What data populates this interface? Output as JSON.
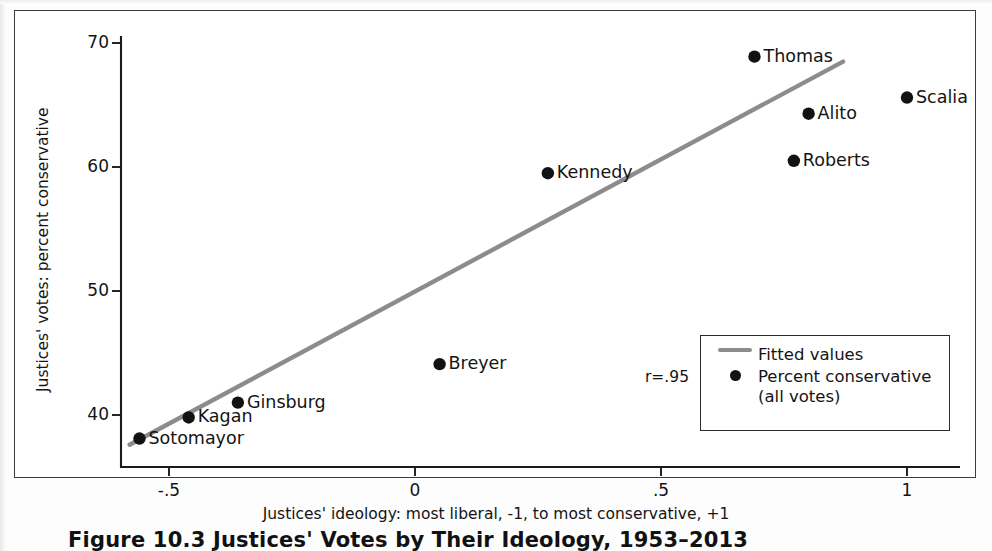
{
  "figure": {
    "caption": "Figure 10.3  Justices' Votes by Their Ideology, 1953–2013",
    "r_note": "r=.95"
  },
  "legend": {
    "fitted_label": "Fitted values",
    "points_label_line1": "Percent conservative",
    "points_label_line2": "(all votes)"
  },
  "colors": {
    "fit_line": "#8c8c8c",
    "point": "#121212",
    "axis": "#1a1a1a",
    "frame": "#3b3b3b"
  },
  "chart_data": {
    "type": "scatter",
    "title": "",
    "xlabel": "Justices' ideology: most liberal, -1, to most conservative, +1",
    "ylabel": "Justices' votes: percent conservative",
    "xlim": [
      -0.62,
      1.1
    ],
    "ylim": [
      36.8,
      71.0
    ],
    "xticks": [
      -0.5,
      0,
      0.5,
      1
    ],
    "xticklabels": [
      "-.5",
      "0",
      ".5",
      "1"
    ],
    "yticks": [
      40,
      50,
      60,
      70
    ],
    "yticklabels": [
      "40",
      "50",
      "60",
      "70"
    ],
    "grid": false,
    "legend_position": "lower-right-inside",
    "correlation": 0.95,
    "points": [
      {
        "label": "Sotomayor",
        "x": -0.56,
        "y": 38.1,
        "label_side": "right"
      },
      {
        "label": "Kagan",
        "x": -0.46,
        "y": 39.8,
        "label_side": "right"
      },
      {
        "label": "Ginsburg",
        "x": -0.36,
        "y": 41.0,
        "label_side": "right"
      },
      {
        "label": "Breyer",
        "x": 0.05,
        "y": 44.1,
        "label_side": "right"
      },
      {
        "label": "Kennedy",
        "x": 0.27,
        "y": 59.5,
        "label_side": "right"
      },
      {
        "label": "Thomas",
        "x": 0.69,
        "y": 68.9,
        "label_side": "right"
      },
      {
        "label": "Roberts",
        "x": 0.77,
        "y": 60.5,
        "label_side": "right"
      },
      {
        "label": "Alito",
        "x": 0.8,
        "y": 64.3,
        "label_side": "right"
      },
      {
        "label": "Scalia",
        "x": 1.0,
        "y": 65.6,
        "label_side": "right"
      }
    ],
    "fit_line": {
      "x0": -0.58,
      "y0": 37.6,
      "x1": 0.87,
      "y1": 68.5
    }
  }
}
